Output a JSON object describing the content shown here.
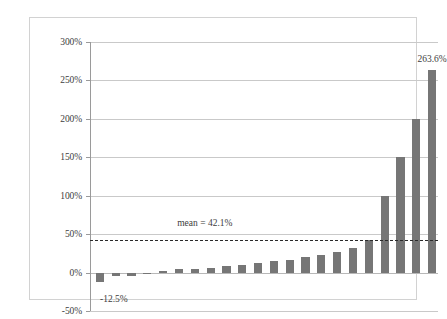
{
  "chart_data": {
    "type": "bar",
    "title": "",
    "subtitle": "",
    "xlabel": "",
    "ylabel": "",
    "ylim": [
      -50,
      300
    ],
    "ytick_labels": [
      "300%",
      "250%",
      "200%",
      "150%",
      "100%",
      "50%",
      "0%",
      "-50%"
    ],
    "ytick_values": [
      300,
      250,
      200,
      150,
      100,
      50,
      0,
      -50
    ],
    "grid": true,
    "legend": null,
    "bar_color": "#767676",
    "categories": [
      "1",
      "2",
      "3",
      "4",
      "5",
      "6",
      "7",
      "8",
      "9",
      "10",
      "11",
      "12",
      "13",
      "14",
      "15",
      "16",
      "17",
      "18",
      "19",
      "20",
      "21",
      "22"
    ],
    "values": [
      -12.5,
      -5.0,
      -5.0,
      0.0,
      1.5,
      4.0,
      5.0,
      6.0,
      8.0,
      10.5,
      13.0,
      15.5,
      17.0,
      20.0,
      23.0,
      27.0,
      32.0,
      43.0,
      100.0,
      150.0,
      200.0,
      263.6
    ],
    "annotations": [
      {
        "name": "min-value-label",
        "text": "-12.5%",
        "bar_index": 0,
        "value": -12.5
      },
      {
        "name": "max-value-label",
        "text": "263.6%",
        "bar_index": 21,
        "value": 263.6
      }
    ],
    "reference_line": {
      "name": "mean-line",
      "label": "mean = 42.1%",
      "value": 42.1,
      "style": "dashed",
      "color": "#2a2a2a"
    }
  }
}
